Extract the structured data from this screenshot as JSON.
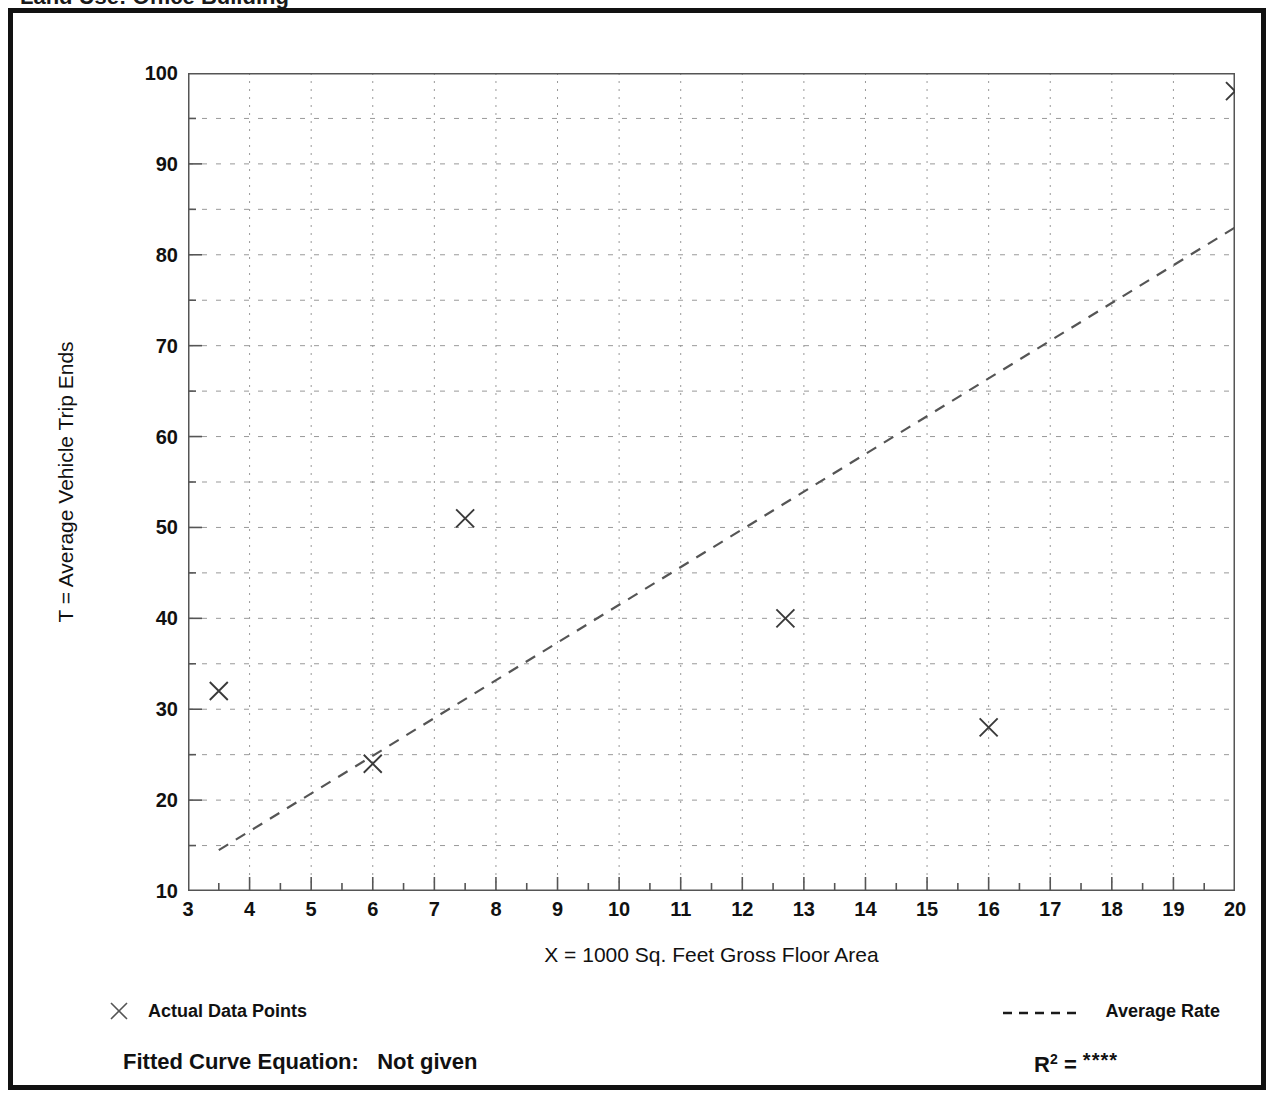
{
  "page": {
    "clipped_title": "Land Use: Office Building"
  },
  "axes": {
    "y_title": "T = Average Vehicle Trip Ends",
    "x_title": "X = 1000 Sq. Feet Gross Floor Area",
    "y_ticks": [
      10,
      20,
      30,
      40,
      50,
      60,
      70,
      80,
      90,
      100
    ],
    "x_ticks": [
      3,
      4,
      5,
      6,
      7,
      8,
      9,
      10,
      11,
      12,
      13,
      14,
      15,
      16,
      17,
      18,
      19,
      20
    ]
  },
  "legend": {
    "data_points_label": "Actual Data Points",
    "data_points_marker": "x-marker-icon",
    "average_rate_label": "Average Rate",
    "average_rate_marker": "dashed-line-icon"
  },
  "footnote": {
    "fitted_curve_label": "Fitted Curve Equation:",
    "fitted_curve_value": "Not given",
    "r_squared_label": "R",
    "r_squared_exponent": "2",
    "r_squared_equals": "=",
    "r_squared_value": "****"
  },
  "colors": {
    "frame": "#111111",
    "axis": "#555555",
    "grid": "#999999",
    "marker": "#3a3a3a",
    "trend": "#555555",
    "background": "#ffffff"
  },
  "chart_data": {
    "type": "scatter",
    "title": "Land Use: Office Building",
    "xlabel": "X = 1000 Sq. Feet Gross Floor Area",
    "ylabel": "T = Average Vehicle Trip Ends",
    "xlim": [
      3,
      20
    ],
    "ylim": [
      10,
      100
    ],
    "grid": true,
    "x_major_step": 1,
    "x_minor_step": 0.5,
    "y_major_step": 10,
    "y_minor_step": 5,
    "legend_position": "below-plot",
    "series": [
      {
        "name": "Actual Data Points",
        "type": "scatter",
        "marker": "x",
        "points": [
          {
            "x": 3.5,
            "y": 32
          },
          {
            "x": 6.0,
            "y": 24
          },
          {
            "x": 7.5,
            "y": 51
          },
          {
            "x": 12.7,
            "y": 40
          },
          {
            "x": 16.0,
            "y": 28
          },
          {
            "x": 20.0,
            "y": 98
          }
        ]
      },
      {
        "name": "Average Rate",
        "type": "line",
        "style": "dashed",
        "points": [
          {
            "x": 3.5,
            "y": 14.5
          },
          {
            "x": 20.0,
            "y": 83.0
          }
        ]
      }
    ],
    "annotations": {
      "fitted_curve_equation": "Not given",
      "r_squared": "****"
    }
  }
}
